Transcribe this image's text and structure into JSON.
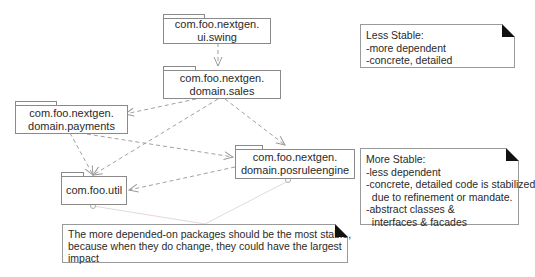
{
  "packages": [
    {
      "id": "ui_swing",
      "line1": "com.foo.nextgen.",
      "line2": "ui.swing"
    },
    {
      "id": "domain_sales",
      "line1": "com.foo.nextgen.",
      "line2": "domain.sales"
    },
    {
      "id": "domain_payments",
      "line1": "com.foo.nextgen.",
      "line2": "domain.payments"
    },
    {
      "id": "domain_posruleengine",
      "line1": "com.foo.nextgen.",
      "line2": "domain.posruleengine"
    },
    {
      "id": "util",
      "line1": "com.foo.util",
      "line2": ""
    }
  ],
  "dependencies": [
    {
      "from": "ui_swing",
      "to": "domain_sales"
    },
    {
      "from": "domain_sales",
      "to": "domain_payments"
    },
    {
      "from": "domain_sales",
      "to": "util"
    },
    {
      "from": "domain_sales",
      "to": "domain_posruleengine"
    },
    {
      "from": "domain_payments",
      "to": "util"
    },
    {
      "from": "domain_payments",
      "to": "domain_posruleengine"
    },
    {
      "from": "domain_posruleengine",
      "to": "util"
    }
  ],
  "notes": {
    "less_stable": {
      "lines": [
        "Less Stable:",
        "-more dependent",
        "-concrete, detailed"
      ]
    },
    "more_stable": {
      "lines": [
        "More Stable:",
        "-less dependent",
        "-concrete, detailed code is stabilized",
        "  due to refinement or mandate.",
        "-abstract classes &",
        "  interfaces & facades"
      ]
    },
    "principle": {
      "lines": [
        "The more depended-on packages should be the most stable,",
        "because when they do change, they could have the largest",
        "impact"
      ]
    }
  },
  "colors": {
    "line": "#9a9a9a",
    "border": "#8a8a8a",
    "note_corner": "#111111",
    "anchor_line": "#e0d0d0"
  }
}
